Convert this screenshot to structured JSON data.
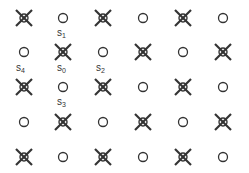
{
  "diagram": {
    "rows": 5,
    "cols": 6,
    "col_x": [
      24,
      63,
      103,
      143,
      183,
      223
    ],
    "row_y": [
      18,
      52,
      87,
      122,
      157
    ],
    "pattern": [
      [
        "x",
        "o",
        "x",
        "o",
        "x",
        "o"
      ],
      [
        "o",
        "x",
        "o",
        "x",
        "o",
        "x"
      ],
      [
        "x",
        "o",
        "x",
        "o",
        "x",
        "o"
      ],
      [
        "o",
        "x",
        "o",
        "x",
        "o",
        "x"
      ],
      [
        "x",
        "o",
        "x",
        "o",
        "x",
        "o"
      ]
    ],
    "labels": [
      {
        "text": "s",
        "sub": "1",
        "x": 57,
        "y": 28
      },
      {
        "text": "s",
        "sub": "4",
        "x": 16,
        "y": 63
      },
      {
        "text": "s",
        "sub": "0",
        "x": 57,
        "y": 63
      },
      {
        "text": "s",
        "sub": "2",
        "x": 96,
        "y": 63
      },
      {
        "text": "s",
        "sub": "3",
        "x": 57,
        "y": 97
      }
    ],
    "stroke_color": "#333333"
  }
}
